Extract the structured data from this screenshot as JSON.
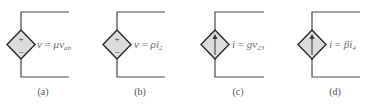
{
  "figures": [
    {
      "id": "a",
      "caption": "(a)",
      "type": "dependent-voltage-source",
      "control": "voltage",
      "plus_sign": "+",
      "minus_sign": "−",
      "label_var": "v",
      "label_eq": " = ",
      "label_coef": "μ",
      "label_ctrl": "v",
      "label_sub": "ab"
    },
    {
      "id": "b",
      "caption": "(b)",
      "type": "dependent-voltage-source",
      "control": "current",
      "plus_sign": "+",
      "minus_sign": "−",
      "label_var": "v",
      "label_eq": " = ",
      "label_coef": "ρ",
      "label_ctrl": "i",
      "label_sub": "2"
    },
    {
      "id": "c",
      "caption": "(c)",
      "type": "dependent-current-source",
      "control": "voltage",
      "arrow": "up",
      "label_var": "i",
      "label_eq": " = ",
      "label_coef": "g",
      "label_ctrl": "v",
      "label_sub": "23"
    },
    {
      "id": "d",
      "caption": "(d)",
      "type": "dependent-current-source",
      "control": "current",
      "arrow": "up",
      "label_var": "i",
      "label_eq": " = ",
      "label_coef": "β",
      "label_ctrl": "i",
      "label_sub": "4"
    }
  ],
  "colors": {
    "wire": "#4a4a4a",
    "diamond_fill": "#dcdcdc",
    "diamond_stroke": "#2a2a2a",
    "label_text": "#6a6a6a"
  }
}
